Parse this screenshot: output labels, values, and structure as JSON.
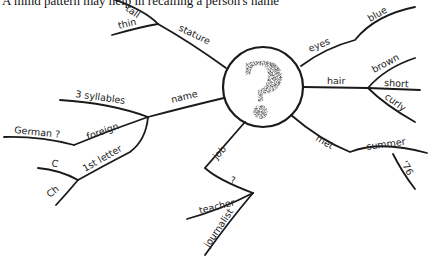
{
  "caption": "A mind pattern may help in recalling a person's name",
  "center": {
    "symbol": "?"
  },
  "branches": {
    "stature": {
      "label": "stature",
      "children": [
        "tall",
        "thin"
      ]
    },
    "name": {
      "label": "name",
      "children": {
        "syllables": "3 syllables",
        "foreign": {
          "label": "foreign",
          "children": [
            "German ?"
          ]
        },
        "first_letter": {
          "label": "1st letter",
          "children": [
            "C",
            "Ch"
          ]
        }
      }
    },
    "job": {
      "label": "job",
      "children": {
        "unknown": {
          "label": "?",
          "children": [
            "teacher",
            "journalist"
          ]
        }
      }
    },
    "eyes": {
      "label": "eyes",
      "children": [
        "blue"
      ]
    },
    "hair": {
      "label": "hair",
      "children": [
        "brown",
        "short",
        "curly"
      ]
    },
    "met": {
      "label": "met",
      "children": {
        "summer": {
          "label": "summer",
          "children": [
            "'76"
          ]
        }
      }
    }
  }
}
